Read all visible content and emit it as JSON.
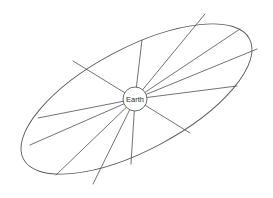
{
  "diagram": {
    "kind": "radial-sector-ellipse",
    "center_body": {
      "label": "Earth",
      "icon": "earth-disc-icon",
      "center_x": 135,
      "center_y": 99,
      "radius": 12,
      "fill_color": "#ffffff",
      "stroke_color": "#58585a"
    },
    "ellipse": {
      "center_x": 136.5,
      "center_y": 99,
      "semi_major": 128,
      "semi_minor": 51,
      "rotation_deg": -28,
      "stroke_color": "#58585a",
      "stroke_width": 0.9,
      "fill": "none"
    },
    "background_color": "#ffffff",
    "line_color": "#58585a",
    "spokes": [
      {
        "name": "spoke-up-left-steep",
        "end_x": 73,
        "end_y": 61
      },
      {
        "name": "spoke-up-vertical",
        "end_x": 142,
        "end_y": 40
      },
      {
        "name": "spoke-up-right-steep",
        "end_x": 205,
        "end_y": 14
      },
      {
        "name": "spoke-up-right-mid",
        "end_x": 240,
        "end_y": 29
      },
      {
        "name": "spoke-up-right-shallow",
        "end_x": 257,
        "end_y": 49
      },
      {
        "name": "spoke-right-horizontal",
        "end_x": 237,
        "end_y": 86
      },
      {
        "name": "spoke-down-right",
        "end_x": 190,
        "end_y": 133
      },
      {
        "name": "spoke-down-vertical",
        "end_x": 131,
        "end_y": 164
      },
      {
        "name": "spoke-down-left-mid",
        "end_x": 93,
        "end_y": 184
      },
      {
        "name": "spoke-down-left-steep",
        "end_x": 56,
        "end_y": 175
      },
      {
        "name": "spoke-left-lower",
        "end_x": 30,
        "end_y": 145
      },
      {
        "name": "spoke-left-horizontal",
        "end_x": 38,
        "end_y": 118
      }
    ]
  }
}
